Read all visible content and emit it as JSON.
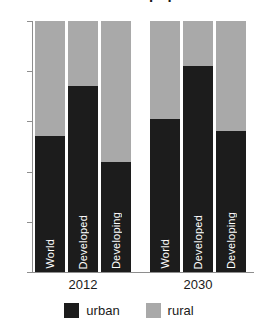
{
  "chart_data": {
    "type": "bar",
    "title": "Urban and rural population",
    "subtitle": "",
    "xlabel": "",
    "ylabel": "",
    "ylim": [
      0,
      100
    ],
    "yticks": [
      0,
      20,
      40,
      60,
      80,
      100
    ],
    "ytick_labels": [
      "0",
      "20",
      "40",
      "60",
      "80",
      "100"
    ],
    "grid": false,
    "stacked": true,
    "stack_total": 100,
    "legend_position": "bottom",
    "groups": [
      {
        "label": "2012",
        "categories": [
          "World",
          "Developed",
          "Developing"
        ]
      },
      {
        "label": "2030",
        "categories": [
          "World",
          "Developed",
          "Developing"
        ]
      }
    ],
    "categories": [
      "World",
      "Developed",
      "Developing",
      "World",
      "Developed",
      "Developing"
    ],
    "series": [
      {
        "name": "urban",
        "color": "#1c1c1c",
        "values": [
          54,
          74,
          44,
          61,
          82,
          56
        ]
      },
      {
        "name": "rural",
        "color": "#a9a9a9",
        "values": [
          46,
          26,
          56,
          39,
          18,
          44
        ]
      }
    ],
    "bars": [
      {
        "group": "2012",
        "category": "World",
        "urban": 54,
        "rural": 46
      },
      {
        "group": "2012",
        "category": "Developed",
        "urban": 74,
        "rural": 26
      },
      {
        "group": "2012",
        "category": "Developing",
        "urban": 44,
        "rural": 56
      },
      {
        "group": "2030",
        "category": "World",
        "urban": 61,
        "rural": 39
      },
      {
        "group": "2030",
        "category": "Developed",
        "urban": 82,
        "rural": 18
      },
      {
        "group": "2030",
        "category": "Developing",
        "urban": 56,
        "rural": 44
      }
    ],
    "legend": [
      {
        "label": "urban",
        "color": "#1c1c1c"
      },
      {
        "label": "rural",
        "color": "#a9a9a9"
      }
    ],
    "colors": {
      "urban": "#1c1c1c",
      "rural": "#a9a9a9",
      "axis": "#8e8e8e",
      "text": "#1a1a1a",
      "bar_label_text": "#ffffff",
      "background": "#ffffff"
    }
  }
}
